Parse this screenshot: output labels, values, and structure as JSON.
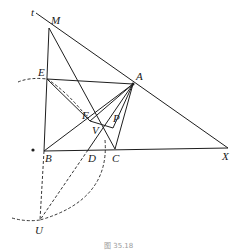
{
  "figure": {
    "caption": "图 35.18",
    "points": {
      "t": {
        "label": "t",
        "x": 36,
        "y": 13
      },
      "M": {
        "label": "M",
        "x": 49,
        "y": 28
      },
      "E": {
        "label": "E",
        "x": 47,
        "y": 79
      },
      "A": {
        "label": "A",
        "x": 133,
        "y": 84
      },
      "F": {
        "label": "F",
        "x": 90,
        "y": 121
      },
      "P": {
        "label": "P",
        "x": 113,
        "y": 120
      },
      "V": {
        "label": "V",
        "x": 103,
        "y": 135
      },
      "B": {
        "label": "B",
        "x": 44,
        "y": 151
      },
      "D": {
        "label": "D",
        "x": 88,
        "y": 150
      },
      "C": {
        "label": "C",
        "x": 115,
        "y": 149
      },
      "X": {
        "label": "X",
        "x": 228,
        "y": 148
      },
      "U": {
        "label": "U",
        "x": 39,
        "y": 222
      },
      "dot": {
        "x": 33,
        "y": 150
      }
    },
    "label_text": {
      "t": "t",
      "M": "M",
      "E": "E",
      "A": "A",
      "F": "F",
      "P": "P",
      "V": "V",
      "B": "B",
      "D": "D",
      "C": "C",
      "X": "X",
      "U": "U"
    }
  }
}
